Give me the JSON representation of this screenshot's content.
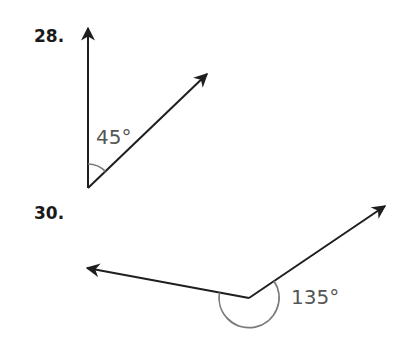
{
  "problems": [
    {
      "number": "28.",
      "angle_label": "45°",
      "angle_degrees": 45,
      "rays": [
        "up",
        "up-right"
      ],
      "arc": "interior"
    },
    {
      "number": "30.",
      "angle_label": "135°",
      "angle_degrees": 135,
      "rays": [
        "left",
        "up-right"
      ],
      "arc": "reflex"
    }
  ],
  "colors": {
    "ray": "#1e1e1e",
    "arc": "#7a7a7a",
    "angle_text": "#555555",
    "label": "#1a1a1a"
  }
}
